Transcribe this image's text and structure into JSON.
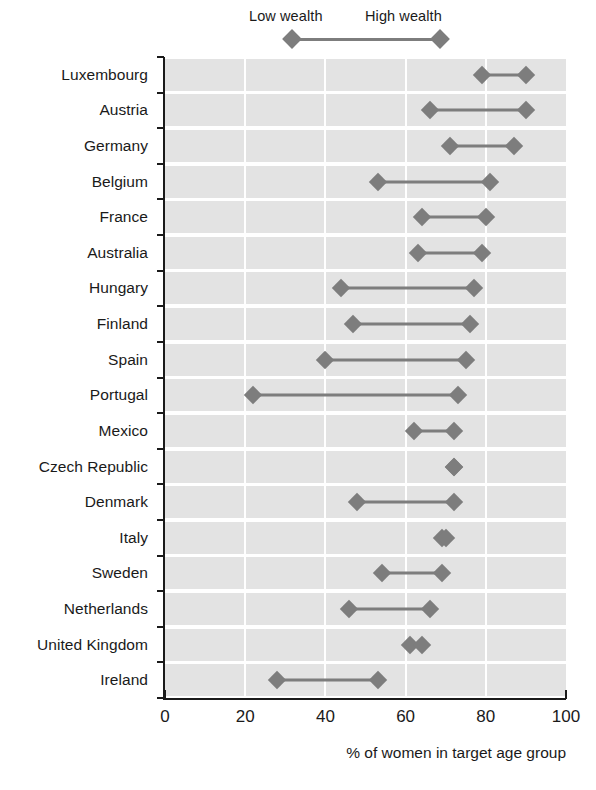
{
  "legend": {
    "low_label": "Low wealth",
    "high_label": "High wealth",
    "marker_color": "#7d7d7d"
  },
  "axis": {
    "x_title": "% of women in target age group",
    "x_ticks": [
      "0",
      "20",
      "40",
      "60",
      "80",
      "100"
    ],
    "x_min": 0,
    "x_max": 100
  },
  "style": {
    "band_color": "#e3e3e3",
    "grid_color": "#ffffff",
    "axis_color": "#1a1a1a"
  },
  "chart_data": {
    "type": "bar",
    "subtype": "dumbbell-range",
    "title": "",
    "xlabel": "% of women in target age group",
    "ylabel": "",
    "xlim": [
      0,
      100
    ],
    "xticks": [
      0,
      20,
      40,
      60,
      80,
      100
    ],
    "grid": "vertical",
    "legend_position": "top",
    "series": [
      {
        "name": "Low wealth",
        "values": [
          79,
          66,
          71,
          53,
          64,
          63,
          44,
          47,
          40,
          22,
          62,
          72,
          48,
          69,
          54,
          46,
          61,
          28
        ]
      },
      {
        "name": "High wealth",
        "values": [
          90,
          90,
          87,
          81,
          80,
          79,
          77,
          76,
          75,
          73,
          72,
          72,
          72,
          70,
          69,
          66,
          64,
          53
        ]
      }
    ],
    "categories": [
      "Luxembourg",
      "Austria",
      "Germany",
      "Belgium",
      "France",
      "Australia",
      "Hungary",
      "Finland",
      "Spain",
      "Portugal",
      "Mexico",
      "Czech Republic",
      "Denmark",
      "Italy",
      "Sweden",
      "Netherlands",
      "United Kingdom",
      "Ireland"
    ],
    "rows": [
      {
        "country": "Luxembourg",
        "low": 79,
        "high": 90
      },
      {
        "country": "Austria",
        "low": 66,
        "high": 90
      },
      {
        "country": "Germany",
        "low": 71,
        "high": 87
      },
      {
        "country": "Belgium",
        "low": 53,
        "high": 81
      },
      {
        "country": "France",
        "low": 64,
        "high": 80
      },
      {
        "country": "Australia",
        "low": 63,
        "high": 79
      },
      {
        "country": "Hungary",
        "low": 44,
        "high": 77
      },
      {
        "country": "Finland",
        "low": 47,
        "high": 76
      },
      {
        "country": "Spain",
        "low": 40,
        "high": 75
      },
      {
        "country": "Portugal",
        "low": 22,
        "high": 73
      },
      {
        "country": "Mexico",
        "low": 62,
        "high": 72
      },
      {
        "country": "Czech Republic",
        "low": 72,
        "high": 72
      },
      {
        "country": "Denmark",
        "low": 48,
        "high": 72
      },
      {
        "country": "Italy",
        "low": 69,
        "high": 70
      },
      {
        "country": "Sweden",
        "low": 54,
        "high": 69
      },
      {
        "country": "Netherlands",
        "low": 46,
        "high": 66
      },
      {
        "country": "United Kingdom",
        "low": 61,
        "high": 64
      },
      {
        "country": "Ireland",
        "low": 28,
        "high": 53
      }
    ]
  }
}
